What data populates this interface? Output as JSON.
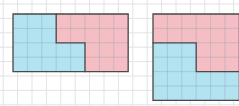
{
  "canvas": {
    "width": 239,
    "height": 106,
    "background_color": "#ffffff"
  },
  "background_grid": {
    "line_color": "#e3e3e6",
    "cell_size_px": 14.4,
    "origin_x": 3.2,
    "origin_y": 4.0,
    "columns": 17,
    "rows": 8
  },
  "palette": {
    "blue_fill": "#b3e3f0",
    "pink_fill": "#f5bec4",
    "outline_stroke": "#4a4a4a",
    "inner_grid_stroke": "#8f9fb0"
  },
  "figures": [
    {
      "id": "figure-left",
      "label": "left-figure",
      "origin_x": 12,
      "origin_y": 13,
      "cell": 14.4,
      "cols": 8,
      "rows": 4,
      "outline_points": "0,0 8,0 8,4 3,4 3,4 0,4 0,0",
      "outline_path": "M 0 0 L 8 0 L 8 4 L 0 4 Z",
      "regions": [
        {
          "name": "blue-region",
          "color_key": "blue_fill",
          "path": "M 0 0 L 3 0 L 3 2 L 5 2 L 5 4 L 0 4 Z",
          "description": "step polygon occupying left portion"
        },
        {
          "name": "pink-region",
          "color_key": "pink_fill",
          "path": "M 3 0 L 8 0 L 8 4 L 5 4 L 5 2 L 3 2 Z",
          "description": "step polygon occupying right portion"
        }
      ],
      "divider_path": "M 3 0 L 3 2 L 5 2 L 5 4"
    },
    {
      "id": "figure-right",
      "label": "right-figure",
      "origin_x": 152,
      "origin_y": 13,
      "cell": 14.4,
      "cols": 6,
      "rows": 6,
      "outline_path": "M 0 0 L 6 0 L 6 6 L 0 6 Z",
      "regions": [
        {
          "name": "pink-region",
          "color_key": "pink_fill",
          "path": "M 0 0 L 6 0 L 6 4 L 3 4 L 3 2 L 0 2 Z",
          "description": "step polygon occupying upper portion"
        },
        {
          "name": "blue-region",
          "color_key": "blue_fill",
          "path": "M 0 2 L 3 2 L 3 4 L 6 4 L 6 6 L 0 6 Z",
          "description": "step polygon occupying lower portion"
        }
      ],
      "divider_path": "M 0 2 L 3 2 L 3 4 L 6 4"
    }
  ],
  "chart_data": {
    "type": "table",
    "title": "",
    "unit_cell_area": 1,
    "figures": [
      {
        "name": "left-figure",
        "bounding_box_cells": {
          "width": 8,
          "height": 4
        },
        "total_area_cells": 32,
        "parts": [
          {
            "name": "blue",
            "color": "#b3e3f0",
            "area_cells": 16,
            "cells": "3x2 block plus 5x2 block"
          },
          {
            "name": "pink",
            "color": "#f5bec4",
            "area_cells": 16,
            "cells": "5x2 block plus 3x2 block"
          }
        ]
      },
      {
        "name": "right-figure",
        "bounding_box_cells": {
          "width": 6,
          "height": 6
        },
        "total_area_cells": 36,
        "parts": [
          {
            "name": "pink",
            "color": "#f5bec4",
            "area_cells": 18,
            "cells": "6x2 block plus 3x2 block"
          },
          {
            "name": "blue",
            "color": "#b3e3f0",
            "area_cells": 18,
            "cells": "3x2 block plus 6x2 block"
          }
        ]
      }
    ]
  }
}
